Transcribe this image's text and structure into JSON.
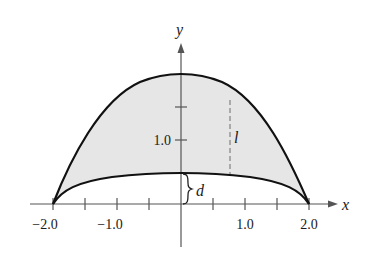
{
  "figure": {
    "type": "region-between-curves",
    "axes": {
      "x_label": "x",
      "y_label": "y",
      "x_range": [
        -2.0,
        2.0
      ],
      "x_ticks": [
        -2.0,
        -1.5,
        -1.0,
        -0.5,
        0.5,
        1.0,
        1.5,
        2.0
      ],
      "x_tick_labels": [
        {
          "value": -2.0,
          "text": "−2.0"
        },
        {
          "value": -1.0,
          "text": "−1.0"
        },
        {
          "value": 1.0,
          "text": "1.0"
        },
        {
          "value": 2.0,
          "text": "2.0"
        }
      ],
      "y_ticks": [
        1.0,
        1.5
      ],
      "y_tick_labels": [
        {
          "value": 1.0,
          "text": "1.0"
        }
      ]
    },
    "curves": {
      "upper": {
        "description": "downward parabola-like arch",
        "peak": [
          0,
          2.0
        ],
        "endpoints": [
          [
            -2.0,
            0
          ],
          [
            2.0,
            0
          ]
        ]
      },
      "lower": {
        "description": "shallow arch",
        "peak": [
          0,
          0.5
        ],
        "endpoints": [
          [
            -2.0,
            0
          ],
          [
            2.0,
            0
          ]
        ]
      }
    },
    "region_fill": "#e6e6e6",
    "stroke_color": "#111111",
    "annotations": {
      "length_label": "l",
      "distance_label": "d",
      "length_line_x": 0.77
    }
  }
}
